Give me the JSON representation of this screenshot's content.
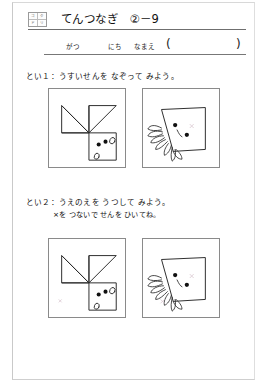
{
  "page": {
    "logo": {
      "name": "kumon-style-badge",
      "cells": [
        "コ",
        "ク",
        "ド",
        "リ"
      ]
    },
    "title": "てんつなぎ　②－9",
    "name_line": {
      "month_label": "がつ",
      "day_label": "にち",
      "name_label": "なまえ",
      "paren_open": "(",
      "paren_close": ")"
    },
    "questions": [
      {
        "id": "q1",
        "text": "とい１：うすいせんを なぞって みよう。",
        "sub": ""
      },
      {
        "id": "q2",
        "text": "とい２：うえのえを うつして みよう。",
        "sub": "×を つないで せんを ひいてね。"
      }
    ],
    "pictures": {
      "q1_left_caption": "かたちの え（ねこのかお）",
      "q1_right_caption": "いかの え",
      "q2_left_caption": "かたちの え（ねこのかお）",
      "q2_right_caption": "いかの え"
    },
    "colors": {
      "ink": "#2a2a2a",
      "rule": "#6f6f6f",
      "box_border": "#8a8a8a",
      "x_guide": "#d9c6cf",
      "page_frame": "#c9c9c9"
    }
  }
}
